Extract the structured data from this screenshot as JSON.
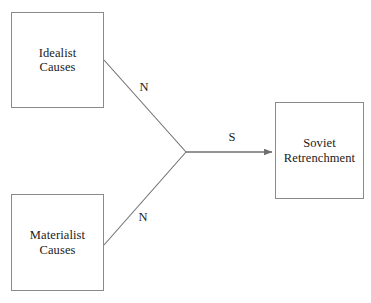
{
  "diagram": {
    "background_color": "#ffffff",
    "stroke_color": "#6f6f6f",
    "box_border_color": "#8a8a8a",
    "text_color": "#1a1a1a",
    "nodes": [
      {
        "id": "idealist",
        "line1": "Idealist",
        "line2": "Causes"
      },
      {
        "id": "materialist",
        "line1": "Materialist",
        "line2": "Causes"
      },
      {
        "id": "soviet",
        "line1": "Soviet",
        "line2": "Retrenchment"
      }
    ],
    "edges": [
      {
        "id": "idealist-to-junction",
        "label": "N",
        "from": "idealist",
        "to": "junction",
        "arrowhead": false
      },
      {
        "id": "materialist-to-junction",
        "label": "N",
        "from": "materialist",
        "to": "junction",
        "arrowhead": false
      },
      {
        "id": "junction-to-soviet",
        "label": "S",
        "from": "junction",
        "to": "soviet",
        "arrowhead": true
      }
    ]
  }
}
